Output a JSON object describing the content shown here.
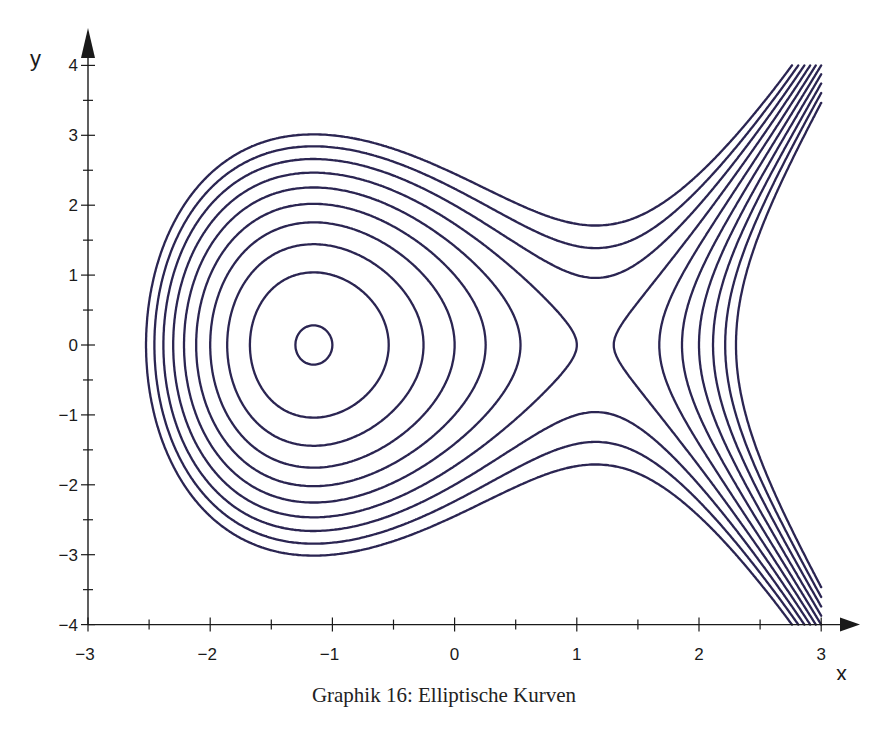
{
  "caption": "Graphik 16: Elliptische Kurven",
  "colors": {
    "curve": "#2b2552",
    "axis": "#1a1a1a"
  },
  "chart_data": {
    "type": "line",
    "title": "Graphik 16: Elliptische Kurven",
    "xlabel": "x",
    "ylabel": "y",
    "xlim": [
      -3,
      3
    ],
    "ylim": [
      -4,
      4
    ],
    "x_ticks": [
      -3,
      -2,
      -1,
      0,
      1,
      2,
      3
    ],
    "x_tick_labels": [
      "−3",
      "−2",
      "−1",
      "0",
      "1",
      "2",
      "3"
    ],
    "y_ticks": [
      -4,
      -3,
      -2,
      -1,
      0,
      1,
      2,
      3,
      4
    ],
    "y_tick_labels": [
      "−4",
      "−3",
      "−2",
      "−1",
      "0",
      "1",
      "2",
      "3",
      "4"
    ],
    "minor_tick_step": 0.5,
    "grid": false,
    "equation": "y^2 = x^3 - 4x + c",
    "levels_c": [
      -3,
      -2,
      -1,
      0,
      1,
      2,
      3,
      4,
      5,
      6
    ]
  }
}
